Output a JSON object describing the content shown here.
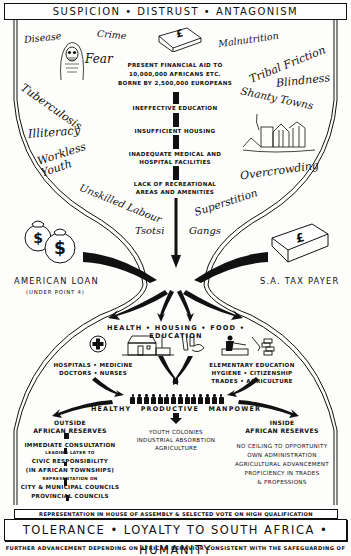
{
  "header": {
    "banner": "SUSPICION • DISTRUST • ANTAGONISM"
  },
  "problems_left": [
    "Disease",
    "Crime",
    "Fear",
    "Tuberculosis",
    "Illiteracy",
    "Workless Youth",
    "Unskilled Labour",
    "Tsotsi"
  ],
  "problems_right": [
    "Malnutrition",
    "Tribal Friction",
    "Blindness",
    "Shanty Towns",
    "Overcrowding",
    "Superstition",
    "Gangs"
  ],
  "funding": {
    "current_title_lines": [
      "PRESENT FINANCIAL AID TO",
      "10,000,000 AFRICANS ETC.",
      "BORNE BY 2,500,000 EUROPEANS"
    ],
    "pound_symbol": "£"
  },
  "deficiencies": [
    {
      "lines": [
        "INEFFECTIVE EDUCATION"
      ]
    },
    {
      "lines": [
        "INSUFFICIENT HOUSING"
      ]
    },
    {
      "lines": [
        "INADEQUATE MEDICAL AND",
        "HOSPITAL FACILITIES"
      ]
    },
    {
      "lines": [
        "LACK OF RECREATIONAL",
        "AREAS AND AMENITIES"
      ]
    }
  ],
  "sources": {
    "left": {
      "title": "AMERICAN LOAN",
      "subtitle": "(UNDER POINT 4)",
      "symbol": "$"
    },
    "right": {
      "title": "S.A. TAX PAYER",
      "symbol": "£"
    }
  },
  "pillars": {
    "banner": "HEALTH • HOUSING • FOOD • EDUCATION",
    "health_lines": [
      "HOSPITALS • MEDICINE",
      "DOCTORS • NURSES"
    ],
    "education_lines": [
      "ELEMENTARY EDUCATION",
      "HYGIENE • CITIZENSHIP",
      "TRADES • AGRICULTURE"
    ]
  },
  "manpower": {
    "title": "HEALTHY PRODUCTIVE MANPOWER",
    "figure_count": 14
  },
  "outside": {
    "title_lines": [
      "OUTSIDE",
      "AFRICAN RESERVES"
    ],
    "steps": [
      {
        "text": "IMMEDIATE CONSULTATION",
        "size": "normal"
      },
      {
        "text": "LEADING LATER TO",
        "size": "small"
      },
      {
        "text": "CIVIC RESPONSIBILITY",
        "size": "normal"
      },
      {
        "text": "(IN AFRICAN TOWNSHIPS)",
        "size": "normal"
      },
      {
        "text": "REPRESENTATION ON",
        "size": "small"
      },
      {
        "text": "CITY & MUNICIPAL COUNCILS",
        "size": "normal"
      },
      {
        "text": "PROVINCIAL COUNCILS",
        "size": "normal"
      }
    ]
  },
  "center_outcomes": [
    "YOUTH COLONIES",
    "INDUSTRIAL ABSORBTION",
    "AGRICULTURE"
  ],
  "inside": {
    "title_lines": [
      "INSIDE",
      "AFRICAN RESERVES"
    ],
    "items": [
      "NO CEILING TO OPPORTUNITY",
      "OWN ADMINISTRATION",
      "AGRICULTURAL ADVANCEMENT",
      "PROFICIENCY IN TRADES",
      "& PROFESSIONS"
    ]
  },
  "representation": "REPRESENTATION IN HOUSE OF ASSEMBLY & SELECTED VOTE ON HIGH QUALIFICATION",
  "bottom_banner": "TOLERANCE • LOYALTY TO SOUTH AFRICA • HUMANITY",
  "footer": "FURTHER ADVANCEMENT DEPENDING ON AFRICAN BEHAVIOR CONSISTENT WITH THE SAFEGUARDING OF"
}
